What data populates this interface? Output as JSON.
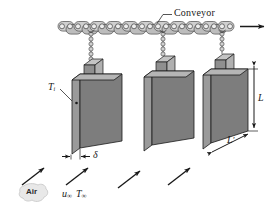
{
  "figure": {
    "background_color": "#ffffff"
  },
  "labels": {
    "conveyor": "Conveyor",
    "initial_temperature": "T",
    "initial_temperature_sub": "i",
    "thickness": "δ",
    "height": "L",
    "depth": "L",
    "depth_prime": "′",
    "air": "Air",
    "velocity": "u",
    "velocity_sub": "∞",
    "free_stream_temperature": "T",
    "free_stream_temperature_sub": "∞"
  },
  "colors": {
    "plate_face": "#7d7d7d",
    "plate_edge": "#9a9a9a",
    "plate_top": "#b5b5b5",
    "outline": "#1a1a1a",
    "chain_fill": "#c9c9c9",
    "chain_stroke": "#4a4a4a",
    "clamp_front": "#8f8f8f",
    "clamp_side": "#bdbdbd",
    "air_bubble": "#e8e8e8",
    "arrow": "#1a1a1a",
    "leader": "#2b2b2b"
  },
  "geometry": {
    "plates": [
      {
        "id": "plate-1",
        "x": 68
      },
      {
        "id": "plate-2",
        "x": 143
      },
      {
        "id": "plate-3",
        "x": 205
      }
    ],
    "conveyor_links": 21,
    "air_arrows": 4
  },
  "annotations": {
    "conveyor_direction": "right",
    "air_flow_direction": "up-right"
  }
}
